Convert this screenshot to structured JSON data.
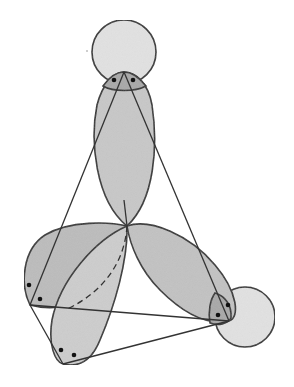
{
  "diagram": {
    "title": "",
    "colors": {
      "background": "#ffffff",
      "stroke": "#333333",
      "lobe_fill": "#c8c8c8",
      "lobe_dark_fill": "#b4b4b4",
      "circle_fill": "#e2e2e2",
      "overlap_fill": "#a8a8a8",
      "dot": "#111111"
    },
    "vertices": {
      "top": [
        124,
        72
      ],
      "center": [
        127,
        226
      ],
      "left": [
        30,
        305
      ],
      "bottom": [
        63,
        364
      ],
      "right": [
        229,
        321
      ]
    },
    "s_orbitals": [
      {
        "name": "top-s-orbital",
        "cx": 124,
        "cy": 52,
        "r": 32
      },
      {
        "name": "right-s-orbital",
        "cx": 245,
        "cy": 317,
        "r": 30
      }
    ],
    "lone_pairs": [
      {
        "name": "top-pair",
        "dots": [
          [
            114,
            80
          ],
          [
            133,
            80
          ]
        ]
      },
      {
        "name": "left-pair",
        "dots": [
          [
            29,
            285
          ],
          [
            40,
            299
          ]
        ]
      },
      {
        "name": "bottom-pair",
        "dots": [
          [
            61,
            350
          ],
          [
            74,
            355
          ]
        ]
      },
      {
        "name": "right-pair",
        "dots": [
          [
            218,
            315
          ],
          [
            228,
            305
          ]
        ]
      }
    ]
  }
}
